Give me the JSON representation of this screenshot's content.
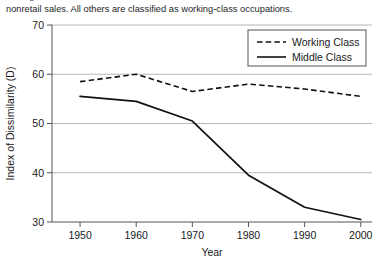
{
  "caption": {
    "line1": "nonretail sales. All others are classified as working-class occupations.",
    "line1_clipped": "management, and"
  },
  "chart_data": {
    "type": "line",
    "title": "",
    "xlabel": "Year",
    "ylabel": "Index of Dissimilarity (D)",
    "x": [
      1950,
      1960,
      1970,
      1980,
      1990,
      2000
    ],
    "xticklabels": [
      "1950",
      "1960",
      "1970",
      "1980",
      "1990",
      "2000"
    ],
    "yticklabels": [
      "30",
      "40",
      "50",
      "60",
      "70"
    ],
    "yticks": [
      30,
      40,
      50,
      60,
      70
    ],
    "xlim": [
      1945,
      2002
    ],
    "ylim": [
      30,
      70
    ],
    "grid": "horizontal",
    "legend_position": "top-right",
    "series": [
      {
        "name": "Working Class",
        "style": "dashed",
        "color": "#111111",
        "values": [
          58.5,
          60.0,
          56.5,
          58.0,
          57.0,
          55.5
        ]
      },
      {
        "name": "Middle Class",
        "style": "solid",
        "color": "#111111",
        "values": [
          55.5,
          54.5,
          50.5,
          39.5,
          33.0,
          30.5
        ]
      }
    ]
  }
}
